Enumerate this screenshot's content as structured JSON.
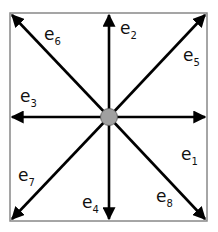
{
  "diagram": {
    "center_node": {
      "label": "",
      "color": "#a0a0a0"
    },
    "box_color": "#888888",
    "arrow_color": "#000000",
    "vectors": [
      {
        "id": "e1",
        "base": "e",
        "sub": "1",
        "direction": "east"
      },
      {
        "id": "e2",
        "base": "e",
        "sub": "2",
        "direction": "north"
      },
      {
        "id": "e3",
        "base": "e",
        "sub": "3",
        "direction": "west"
      },
      {
        "id": "e4",
        "base": "e",
        "sub": "4",
        "direction": "south"
      },
      {
        "id": "e5",
        "base": "e",
        "sub": "5",
        "direction": "north-east"
      },
      {
        "id": "e6",
        "base": "e",
        "sub": "6",
        "direction": "north-west"
      },
      {
        "id": "e7",
        "base": "e",
        "sub": "7",
        "direction": "south-west"
      },
      {
        "id": "e8",
        "base": "e",
        "sub": "8",
        "direction": "south-east"
      }
    ]
  }
}
